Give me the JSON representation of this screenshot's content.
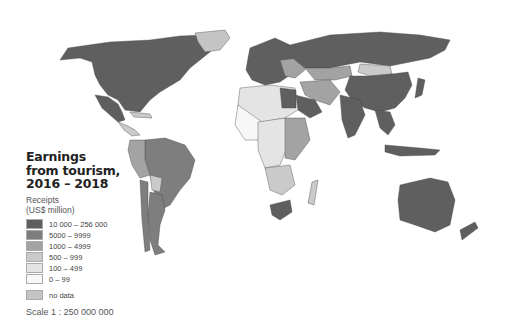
{
  "map": {
    "title_lines": [
      "Earnings",
      "from tourism,",
      "2016 – 2018"
    ],
    "subtitle_lines": [
      "Receipts",
      "(US$ million)"
    ],
    "legend": [
      {
        "label": "10 000 – 256 000",
        "color": "#5f5f5f"
      },
      {
        "label": "5000 – 9999",
        "color": "#7e7e7e"
      },
      {
        "label": "1000 – 4999",
        "color": "#a3a3a3"
      },
      {
        "label": "500 – 999",
        "color": "#cacaca"
      },
      {
        "label": "100 – 499",
        "color": "#e4e4e4"
      },
      {
        "label": "0 – 99",
        "color": "#f7f7f7"
      }
    ],
    "no_data": {
      "label": "no data",
      "color": "#c4c4c4"
    },
    "scale": "Scale 1 : 250 000 000",
    "projection": "world choropleth map"
  }
}
